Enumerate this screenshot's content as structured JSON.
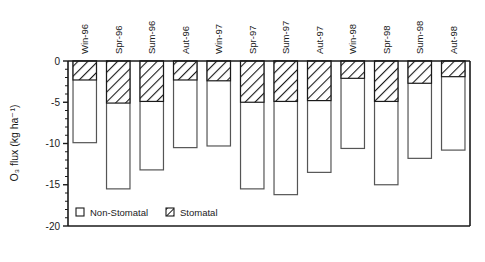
{
  "chart_data": {
    "type": "bar",
    "title": "",
    "subtitle": "",
    "xlabel": "",
    "ylabel": "O₃ flux (kg ha⁻¹)",
    "ylim": [
      -20,
      0
    ],
    "yticks": [
      0,
      -5,
      -10,
      -15,
      -20
    ],
    "ytick_labels": [
      "0",
      "-5",
      "-10",
      "-15",
      "-20"
    ],
    "grid": false,
    "stacked": true,
    "orientation": "vertical-negative",
    "legend_position": "inside-bottom-left",
    "categories": [
      "Win-96",
      "Spr-96",
      "Sum-96",
      "Aut-96",
      "Win-97",
      "Spr-97",
      "Sum-97",
      "Aut-97",
      "Win-98",
      "Spr-98",
      "Sum-98",
      "Aut-98"
    ],
    "series": [
      {
        "name": "Stomatal",
        "fill": "hatched",
        "values": [
          -2.3,
          -5.1,
          -4.9,
          -2.3,
          -2.4,
          -5.0,
          -4.9,
          -4.8,
          -2.1,
          -4.9,
          -2.7,
          -1.9
        ]
      },
      {
        "name": "Non-Stomatal",
        "fill": "white",
        "values": [
          -7.6,
          -10.4,
          -8.3,
          -8.2,
          -7.9,
          -10.5,
          -11.3,
          -8.7,
          -8.5,
          -10.1,
          -9.1,
          -8.9
        ]
      }
    ],
    "totals": [
      -9.9,
      -15.5,
      -13.2,
      -10.5,
      -10.3,
      -15.5,
      -16.2,
      -13.5,
      -10.6,
      -15.0,
      -11.8,
      -10.8
    ],
    "legend": [
      {
        "label": "Non-Stomatal",
        "swatch": "white-square"
      },
      {
        "label": "Stomatal",
        "swatch": "hatched-square"
      }
    ],
    "colors": {
      "axis": "#1a1a1a",
      "bar_outline": "#555555",
      "bar_fill": "#ffffff",
      "hatch": "#1a1a1a",
      "background": "#ffffff"
    }
  }
}
